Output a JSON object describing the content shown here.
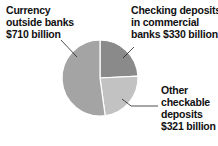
{
  "chart_data": {
    "type": "pie",
    "title": "",
    "units": "billion USD",
    "categories": [
      "Checking deposits in commercial banks",
      "Other checkable deposits",
      "Currency outside banks"
    ],
    "values": [
      330,
      321,
      710
    ],
    "slices": [
      {
        "name": "Checking deposits in commercial banks",
        "value": 330,
        "color": "#8a8a8a",
        "label_lines": [
          "Checking deposits",
          "in commercial",
          "banks $330 billion"
        ]
      },
      {
        "name": "Other checkable deposits",
        "value": 321,
        "color": "#c2c2c2",
        "label_lines": [
          "Other",
          "checkable",
          "deposits",
          "$321 billion"
        ]
      },
      {
        "name": "Currency outside banks",
        "value": 710,
        "color": "#a4a4a4",
        "label_lines": [
          "Currency",
          "outside banks",
          "$710 billion"
        ]
      }
    ],
    "start_angle_deg": 0,
    "direction": "clockwise",
    "legend": "none (direct labels with leader lines)"
  },
  "labels": {
    "currency": {
      "line1": "Currency",
      "line2": "outside banks",
      "line3": "$710 billion"
    },
    "checking": {
      "line1": "Checking deposits",
      "line2": "in commercial",
      "line3": "banks $330 billion"
    },
    "other": {
      "line1": "Other",
      "line2": "checkable",
      "line3": "deposits",
      "line4": "$321 billion"
    }
  }
}
